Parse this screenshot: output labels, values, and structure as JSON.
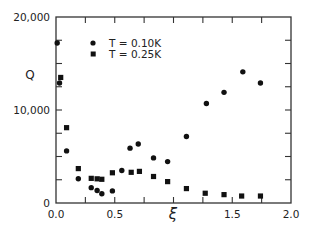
{
  "chart_data": {
    "type": "scatter",
    "title": "",
    "xlabel": "ξ",
    "ylabel": "Q",
    "xlim": [
      0,
      2.0
    ],
    "ylim": [
      0,
      20000
    ],
    "x_ticks": [
      0,
      0.25,
      0.5,
      0.75,
      1.0,
      1.25,
      1.5,
      1.75,
      2.0
    ],
    "x_tick_labels": [
      {
        "value": 0.0,
        "label": "0.0"
      },
      {
        "value": 0.5,
        "label": "0.5"
      },
      {
        "value": 1.5,
        "label": "1.5"
      },
      {
        "value": 2.0,
        "label": "2.0"
      }
    ],
    "y_ticks": [
      0,
      2500,
      5000,
      7500,
      10000,
      12500,
      15000,
      17500,
      20000
    ],
    "y_tick_labels": [
      {
        "value": 0,
        "label": "0"
      },
      {
        "value": 10000,
        "label": "10,000"
      },
      {
        "value": 20000,
        "label": "20,000"
      }
    ],
    "grid": false,
    "legend_position": "upper-left-inside",
    "series": [
      {
        "name": "T = 0.10K",
        "marker": "circle",
        "color": "#111111",
        "points": [
          [
            0.01,
            17200
          ],
          [
            0.03,
            12900
          ],
          [
            0.09,
            5600
          ],
          [
            0.19,
            2600
          ],
          [
            0.3,
            1650
          ],
          [
            0.35,
            1350
          ],
          [
            0.39,
            1000
          ],
          [
            0.48,
            1300
          ],
          [
            0.56,
            3500
          ],
          [
            0.63,
            5900
          ],
          [
            0.7,
            6350
          ],
          [
            0.83,
            4850
          ],
          [
            0.95,
            4450
          ],
          [
            1.11,
            7150
          ],
          [
            1.28,
            10700
          ],
          [
            1.43,
            11900
          ],
          [
            1.59,
            14100
          ],
          [
            1.74,
            12900
          ]
        ]
      },
      {
        "name": "T = 0.25K",
        "marker": "square",
        "color": "#111111",
        "points": [
          [
            0.04,
            13500
          ],
          [
            0.09,
            8100
          ],
          [
            0.19,
            3700
          ],
          [
            0.3,
            2650
          ],
          [
            0.35,
            2600
          ],
          [
            0.39,
            2550
          ],
          [
            0.48,
            3250
          ],
          [
            0.64,
            3300
          ],
          [
            0.71,
            3400
          ],
          [
            0.83,
            2850
          ],
          [
            0.95,
            2300
          ],
          [
            1.11,
            1550
          ],
          [
            1.27,
            1050
          ],
          [
            1.43,
            900
          ],
          [
            1.58,
            750
          ],
          [
            1.74,
            750
          ]
        ]
      }
    ]
  },
  "legend": {
    "items": [
      {
        "label": "T = 0.10K",
        "marker": "circle"
      },
      {
        "label": "T = 0.25K",
        "marker": "square"
      }
    ]
  },
  "axes": {
    "xlabel": "ξ",
    "ylabel": "Q"
  }
}
